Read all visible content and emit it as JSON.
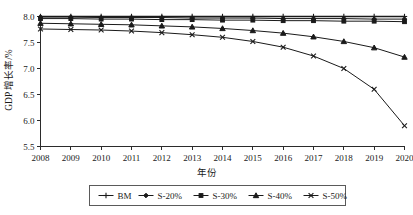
{
  "chart_data": {
    "type": "line",
    "title": "",
    "xlabel": "年份",
    "ylabel": "GDP 增长率/%",
    "x": [
      2008,
      2009,
      2010,
      2011,
      2012,
      2013,
      2014,
      2015,
      2016,
      2017,
      2018,
      2019,
      2020
    ],
    "xticklabels": [
      "2008",
      "2009",
      "2010",
      "2011",
      "2012",
      "2013",
      "2014",
      "2015",
      "2016",
      "2017",
      "2018",
      "2019",
      "2020"
    ],
    "yticklabels": [
      "5.5",
      "6.0",
      "6.5",
      "7.0",
      "7.5",
      "8.0"
    ],
    "yticks": [
      5.5,
      6.0,
      6.5,
      7.0,
      7.5,
      8.0
    ],
    "ylim": [
      5.5,
      8.0
    ],
    "xlim": [
      2008,
      2020
    ],
    "grid": false,
    "legend_position": "below-axis",
    "series": [
      {
        "name": "BM",
        "marker": "plus",
        "values": [
          8.0,
          8.0,
          8.0,
          8.0,
          8.0,
          8.0,
          8.0,
          8.0,
          8.0,
          8.0,
          8.0,
          8.0,
          8.0
        ]
      },
      {
        "name": "S-20%",
        "marker": "diamond",
        "values": [
          7.99,
          7.99,
          7.98,
          7.98,
          7.98,
          7.97,
          7.97,
          7.97,
          7.96,
          7.96,
          7.96,
          7.95,
          7.95
        ]
      },
      {
        "name": "S-30%",
        "marker": "square",
        "values": [
          7.96,
          7.96,
          7.95,
          7.95,
          7.94,
          7.94,
          7.93,
          7.93,
          7.92,
          7.92,
          7.91,
          7.91,
          7.9
        ]
      },
      {
        "name": "S-40%",
        "marker": "triangle",
        "values": [
          7.87,
          7.86,
          7.85,
          7.84,
          7.82,
          7.8,
          7.77,
          7.73,
          7.68,
          7.61,
          7.52,
          7.4,
          7.22
        ]
      },
      {
        "name": "S-50%",
        "marker": "x",
        "values": [
          7.76,
          7.75,
          7.74,
          7.72,
          7.69,
          7.65,
          7.6,
          7.52,
          7.41,
          7.24,
          7.0,
          6.6,
          5.9
        ]
      }
    ]
  },
  "legend": {
    "entries": [
      "BM",
      "S-20%",
      "S-30%",
      "S-40%",
      "S-50%"
    ]
  }
}
